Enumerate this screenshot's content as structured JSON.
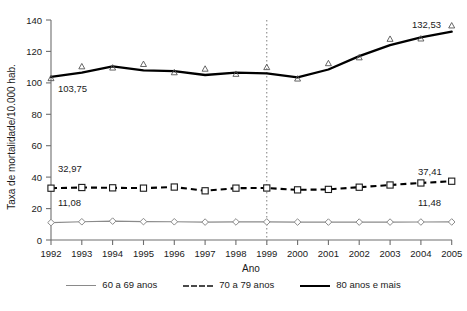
{
  "chart_data": {
    "type": "line",
    "title": "",
    "xlabel": "Ano",
    "ylabel": "Taxa de mortalidade/10.000 hab.",
    "x": [
      1992,
      1993,
      1994,
      1995,
      1996,
      1997,
      1998,
      1999,
      2000,
      2001,
      2002,
      2003,
      2004,
      2005
    ],
    "xtick_labels": [
      "1992",
      "1993",
      "1994",
      "1995",
      "1996",
      "1997",
      "1998",
      "1999",
      "2000",
      "2001",
      "2002",
      "2003",
      "2004",
      "2005"
    ],
    "ytick_labels": [
      "0",
      "20",
      "40",
      "60",
      "80",
      "100",
      "120",
      "140"
    ],
    "yticks": [
      0,
      20,
      40,
      60,
      80,
      100,
      120,
      140
    ],
    "ylim": [
      0,
      140
    ],
    "grid": false,
    "legend_position": "bottom",
    "reference_line": {
      "x": 1999,
      "style": "dotted",
      "color": "#8a8a8a"
    },
    "series": [
      {
        "name": "60 a 69 anos",
        "marker": "diamond",
        "line_style": "solid",
        "color": "#8a8a8a",
        "values": [
          11.08,
          11.6,
          12.0,
          11.7,
          11.6,
          11.4,
          11.5,
          11.5,
          11.4,
          11.4,
          11.4,
          11.4,
          11.45,
          11.48
        ]
      },
      {
        "name": "70 a 79 anos",
        "marker": "square",
        "line_style": "dashed",
        "color": "#000000",
        "values": [
          32.97,
          33.4,
          33.2,
          33.0,
          33.7,
          31.3,
          33.0,
          33.1,
          31.9,
          32.2,
          33.6,
          35.0,
          36.3,
          37.41
        ]
      },
      {
        "name": "80 anos e mais",
        "marker": "triangle",
        "line_style": "solid",
        "color": "#000000",
        "values": [
          103.75,
          106.5,
          110.5,
          108.0,
          107.5,
          105.0,
          106.5,
          106.0,
          103.5,
          108.5,
          117.0,
          124.0,
          129.0,
          132.53
        ]
      }
    ],
    "point_labels": [
      {
        "text": "103,75",
        "series": "80 anos e mais",
        "x": 1992,
        "anchor": "start"
      },
      {
        "text": "132,53",
        "series": "80 anos e mais",
        "x": 2005,
        "anchor": "end"
      },
      {
        "text": "32,97",
        "series": "70 a 79 anos",
        "x": 1992,
        "anchor": "start"
      },
      {
        "text": "37,41",
        "series": "70 a 79 anos",
        "x": 2005,
        "anchor": "end"
      },
      {
        "text": "11,08",
        "series": "60 a 69 anos",
        "x": 1992,
        "anchor": "start"
      },
      {
        "text": "11,48",
        "series": "60 a 69 anos",
        "x": 2005,
        "anchor": "end"
      }
    ]
  },
  "axes": {
    "y_title": "Taxa de mortalidade/10.000 hab.",
    "x_title": "Ano"
  },
  "legend": {
    "items": [
      {
        "label": "60 a 69 anos",
        "swatch": "line-solid-gray-swatch"
      },
      {
        "label": "70 a 79 anos",
        "swatch": "line-dashed-black-swatch"
      },
      {
        "label": "80 anos e mais",
        "swatch": "line-solid-black-swatch"
      }
    ]
  },
  "labels": {
    "l_103_75": "103,75",
    "l_132_53": "132,53",
    "l_32_97": "32,97",
    "l_37_41": "37,41",
    "l_11_08": "11,08",
    "l_11_48": "11,48",
    "y0": "0",
    "y20": "20",
    "y40": "40",
    "y60": "60",
    "y80": "80",
    "y100": "100",
    "y120": "120",
    "y140": "140",
    "x1992": "1992",
    "x1993": "1993",
    "x1994": "1994",
    "x1995": "1995",
    "x1996": "1996",
    "x1997": "1997",
    "x1998": "1998",
    "x1999": "1999",
    "x2000": "2000",
    "x2001": "2001",
    "x2002": "2002",
    "x2003": "2003",
    "x2004": "2004",
    "x2005": "2005"
  }
}
